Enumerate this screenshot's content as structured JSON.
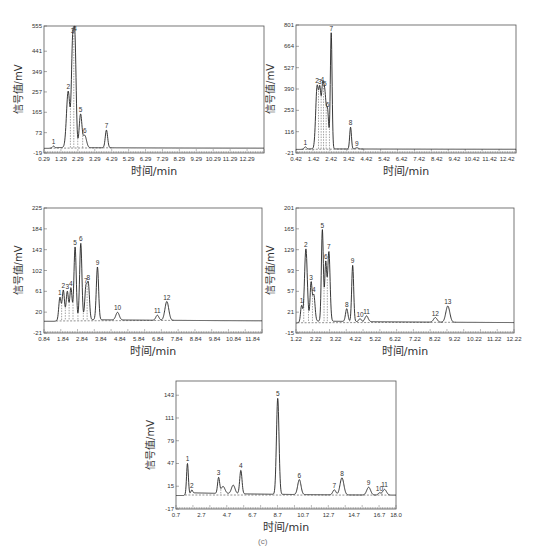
{
  "figure": {
    "caption": "(c)",
    "xlabel": "时间/min",
    "ylabel": "信号值/mV"
  },
  "chart_data": [
    {
      "type": "line",
      "panel": "top-left",
      "title": "",
      "xlabel": "时间/min",
      "ylabel": "信号值/mV",
      "xlim": [
        0.29,
        13.29
      ],
      "ylim": [
        -19,
        555
      ],
      "xticks": [
        "0.29",
        "1.29",
        "2.29",
        "3.29",
        "4.29",
        "5.29",
        "6.29",
        "7.29",
        "8.29",
        "9.29",
        "10.29",
        "11.29",
        "12.29"
      ],
      "yticks": [
        "-19",
        "73",
        "165",
        "257",
        "349",
        "441",
        "555"
      ],
      "grid": false,
      "peaks": [
        {
          "label": "1",
          "x": 0.85,
          "y": 8,
          "w": 0.06
        },
        {
          "label": "2",
          "x": 1.72,
          "y": 255,
          "w": 0.1
        },
        {
          "label": "3",
          "x": 1.98,
          "y": 440,
          "w": 0.07
        },
        {
          "label": "4",
          "x": 2.12,
          "y": 460,
          "w": 0.07
        },
        {
          "label": "5",
          "x": 2.45,
          "y": 150,
          "w": 0.08
        },
        {
          "label": "6",
          "x": 2.7,
          "y": 55,
          "w": 0.1
        },
        {
          "label": "7",
          "x": 3.98,
          "y": 80,
          "w": 0.07
        }
      ]
    },
    {
      "type": "line",
      "panel": "top-right",
      "title": "",
      "xlabel": "时间/min",
      "ylabel": "信号值/mV",
      "xlim": [
        0.42,
        12.92
      ],
      "ylim": [
        -21,
        801
      ],
      "xticks": [
        "0.42",
        "1.42",
        "2.42",
        "3.42",
        "4.42",
        "5.42",
        "6.42",
        "7.42",
        "8.42",
        "9.42",
        "10.42",
        "11.42",
        "12.42"
      ],
      "yticks": [
        "-21",
        "116",
        "253",
        "390",
        "527",
        "664",
        "801"
      ],
      "grid": false,
      "peaks": [
        {
          "label": "1",
          "x": 0.95,
          "y": 15,
          "w": 0.06
        },
        {
          "label": "2",
          "x": 1.62,
          "y": 400,
          "w": 0.08
        },
        {
          "label": "3",
          "x": 1.78,
          "y": 330,
          "w": 0.06
        },
        {
          "label": "4",
          "x": 1.92,
          "y": 300,
          "w": 0.06
        },
        {
          "label": "5",
          "x": 2.05,
          "y": 360,
          "w": 0.08
        },
        {
          "label": "6",
          "x": 2.22,
          "y": 220,
          "w": 0.06
        },
        {
          "label": "7",
          "x": 2.42,
          "y": 745,
          "w": 0.05
        },
        {
          "label": "8",
          "x": 3.52,
          "y": 140,
          "w": 0.05
        },
        {
          "label": "9",
          "x": 3.88,
          "y": 8,
          "w": 0.08
        }
      ]
    },
    {
      "type": "line",
      "panel": "middle-left",
      "title": "",
      "xlabel": "时间/min",
      "ylabel": "信号值/mV",
      "xlim": [
        0.84,
        12.34
      ],
      "ylim": [
        -21,
        225
      ],
      "xticks": [
        "0.84",
        "1.84",
        "2.84",
        "3.84",
        "4.84",
        "5.84",
        "6.84",
        "7.84",
        "8.84",
        "9.84",
        "10.84",
        "11.84"
      ],
      "yticks": [
        "-21",
        "20",
        "61",
        "102",
        "143",
        "184",
        "225"
      ],
      "grid": false,
      "peaks": [
        {
          "label": "1",
          "x": 1.68,
          "y": 45,
          "w": 0.06
        },
        {
          "label": "2",
          "x": 1.86,
          "y": 58,
          "w": 0.06
        },
        {
          "label": "3",
          "x": 2.07,
          "y": 55,
          "w": 0.06
        },
        {
          "label": "4",
          "x": 2.26,
          "y": 62,
          "w": 0.06
        },
        {
          "label": "5",
          "x": 2.48,
          "y": 143,
          "w": 0.06
        },
        {
          "label": "6",
          "x": 2.78,
          "y": 150,
          "w": 0.06
        },
        {
          "label": "7",
          "x": 3.05,
          "y": 62,
          "w": 0.06
        },
        {
          "label": "8",
          "x": 3.18,
          "y": 68,
          "w": 0.06
        },
        {
          "label": "9",
          "x": 3.66,
          "y": 104,
          "w": 0.06
        },
        {
          "label": "10",
          "x": 4.72,
          "y": 15,
          "w": 0.09
        },
        {
          "label": "11",
          "x": 6.82,
          "y": 10,
          "w": 0.08
        },
        {
          "label": "12",
          "x": 7.32,
          "y": 37,
          "w": 0.1
        }
      ]
    },
    {
      "type": "line",
      "panel": "middle-right",
      "title": "",
      "xlabel": "时间/min",
      "ylabel": "信号值/mV",
      "xlim": [
        1.22,
        12.22
      ],
      "ylim": [
        -15,
        201
      ],
      "xticks": [
        "1.22",
        "2.22",
        "3.22",
        "4.22",
        "5.22",
        "6.22",
        "7.22",
        "8.22",
        "9.22",
        "10.22",
        "11.22",
        "12.22"
      ],
      "yticks": [
        "-15",
        "21",
        "57",
        "93",
        "129",
        "165",
        "201"
      ],
      "grid": false,
      "peaks": [
        {
          "label": "1",
          "x": 1.5,
          "y": 28,
          "w": 0.05
        },
        {
          "label": "2",
          "x": 1.72,
          "y": 125,
          "w": 0.07
        },
        {
          "label": "3",
          "x": 1.98,
          "y": 65,
          "w": 0.05
        },
        {
          "label": "4",
          "x": 2.12,
          "y": 45,
          "w": 0.06
        },
        {
          "label": "5",
          "x": 2.55,
          "y": 158,
          "w": 0.05
        },
        {
          "label": "6",
          "x": 2.72,
          "y": 100,
          "w": 0.05
        },
        {
          "label": "7",
          "x": 2.88,
          "y": 120,
          "w": 0.06
        },
        {
          "label": "8",
          "x": 3.78,
          "y": 22,
          "w": 0.06
        },
        {
          "label": "9",
          "x": 4.08,
          "y": 97,
          "w": 0.05
        },
        {
          "label": "10",
          "x": 4.45,
          "y": 5,
          "w": 0.06
        },
        {
          "label": "11",
          "x": 4.78,
          "y": 10,
          "w": 0.08
        },
        {
          "label": "12",
          "x": 8.25,
          "y": 8,
          "w": 0.09
        },
        {
          "label": "13",
          "x": 8.88,
          "y": 28,
          "w": 0.1
        }
      ]
    },
    {
      "type": "line",
      "panel": "bottom-center",
      "title": "",
      "xlabel": "时间/min",
      "ylabel": "信号值/mV",
      "xlim": [
        0.7,
        18.0
      ],
      "ylim": [
        -17,
        163
      ],
      "xticks": [
        "0.7",
        "2.7",
        "4.7",
        "6.7",
        "8.7",
        "10.7",
        "12.7",
        "14.7",
        "16.7",
        "18.0"
      ],
      "yticks": [
        "-17",
        "15",
        "47",
        "79",
        "111",
        "143"
      ],
      "grid": false,
      "peaks": [
        {
          "label": "1",
          "x": 1.6,
          "y": 43,
          "w": 0.07
        },
        {
          "label": "2",
          "x": 1.95,
          "y": 4,
          "w": 0.06
        },
        {
          "label": "3",
          "x": 4.05,
          "y": 22,
          "w": 0.08
        },
        {
          "label": "",
          "x": 4.4,
          "y": 10,
          "w": 0.15
        },
        {
          "label": "",
          "x": 5.2,
          "y": 12,
          "w": 0.14
        },
        {
          "label": "4",
          "x": 5.8,
          "y": 33,
          "w": 0.09
        },
        {
          "label": "5",
          "x": 8.7,
          "y": 135,
          "w": 0.1
        },
        {
          "label": "6",
          "x": 10.4,
          "y": 21,
          "w": 0.13
        },
        {
          "label": "7",
          "x": 13.15,
          "y": 7,
          "w": 0.12
        },
        {
          "label": "8",
          "x": 13.75,
          "y": 24,
          "w": 0.15
        },
        {
          "label": "9",
          "x": 15.85,
          "y": 11,
          "w": 0.15
        },
        {
          "label": "10",
          "x": 16.7,
          "y": 3,
          "w": 0.1
        },
        {
          "label": "11",
          "x": 17.1,
          "y": 8,
          "w": 0.15
        }
      ]
    }
  ]
}
